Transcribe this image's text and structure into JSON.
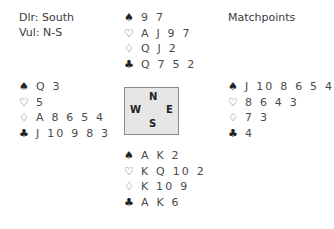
{
  "info": {
    "dealer": "Dlr: South",
    "vulnerability": "Vul: N-S",
    "scoring": "Matchpoints"
  },
  "suit_symbols": {
    "spades": "♠",
    "hearts": "♡",
    "diamonds": "♢",
    "clubs": "♣"
  },
  "hands": {
    "north": {
      "spades": "9 7",
      "hearts": "A J 9 7",
      "diamonds": "Q J 2",
      "clubs": "Q 7 5 2"
    },
    "west": {
      "spades": "Q 3",
      "hearts": "5",
      "diamonds": "A 8 6 5 4",
      "clubs": "J 10 9 8 3"
    },
    "east": {
      "spades": "J 10 8 6 5 4",
      "hearts": "8 6 4 3",
      "diamonds": "7 3",
      "clubs": "4"
    },
    "south": {
      "spades": "A K 2",
      "hearts": "K Q 10 2",
      "diamonds": "K 10 9",
      "clubs": "A K 6"
    }
  },
  "compass": {
    "n": "N",
    "w": "W",
    "e": "E",
    "s": "S"
  }
}
